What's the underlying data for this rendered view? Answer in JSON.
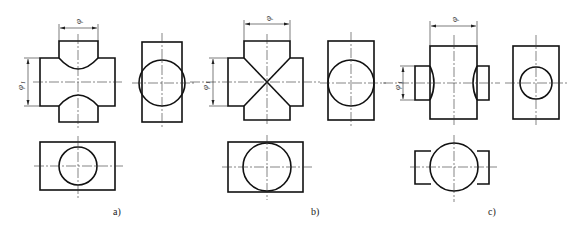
{
  "figure": {
    "panels": [
      {
        "id": "a",
        "caption": "a)",
        "dimension_diameter": "φ",
        "dimension_diameter_1": "φ1",
        "description": "Equal-axis cross: horizontal cylinder φ1 larger than vertical cylinder φ; curved intersection lines bend toward horizontal axis"
      },
      {
        "id": "b",
        "caption": "b)",
        "dimension_diameter": "φ",
        "dimension_diameter_1": "φ1",
        "description": "Equal diameters φ = φ1; intersection lines appear as straight diagonals (X)"
      },
      {
        "id": "c",
        "caption": "c)",
        "dimension_diameter": "φ",
        "dimension_diameter_1": "φ1",
        "description": "Vertical cylinder φ larger than horizontal cylinder φ1; curved intersection lines bend toward vertical axis"
      }
    ],
    "subscript_1": "1"
  }
}
